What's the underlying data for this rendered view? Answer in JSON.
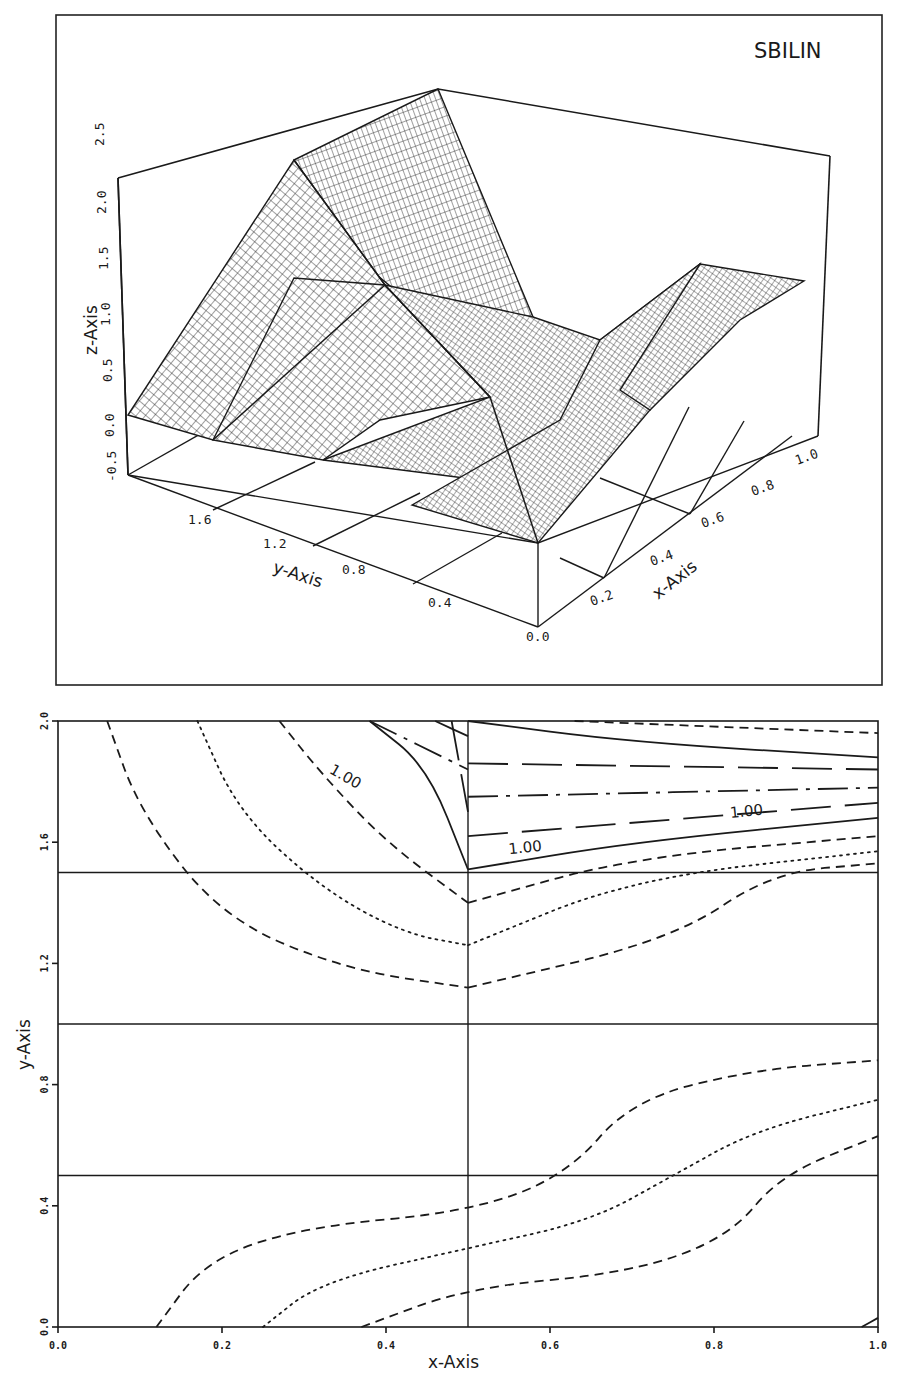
{
  "chart_data": [
    {
      "type": "surface3d",
      "title": "SBILIN",
      "xlabel": "x-Axis",
      "ylabel": "y-Axis",
      "zlabel": "z-Axis",
      "x_ticks": [
        "0.0",
        "0.2",
        "0.4",
        "0.6",
        "0.8",
        "1.0"
      ],
      "y_ticks": [
        "0.4",
        "0.8",
        "1.2",
        "1.6"
      ],
      "z_ticks": [
        "-0.5",
        "0.0",
        "0.5",
        "1.0",
        "1.5",
        "2.0",
        "2.5"
      ],
      "xlim": [
        0.0,
        1.0
      ],
      "ylim": [
        0.0,
        2.0
      ],
      "zlim": [
        -0.5,
        2.5
      ],
      "grid": true,
      "surface_nodes": {
        "description": "Piecewise bilinear surface values at node grid (x across, y down)",
        "x": [
          0.0,
          0.5,
          1.0
        ],
        "y": [
          0.0,
          0.5,
          1.0,
          1.5,
          2.0
        ],
        "z": [
          [
            0.0,
            0.0,
            1.0
          ],
          [
            0.0,
            0.0,
            1.0
          ],
          [
            0.0,
            0.5,
            1.0
          ],
          [
            0.0,
            2.0,
            1.0
          ],
          [
            0.0,
            2.3,
            1.0
          ]
        ]
      }
    },
    {
      "type": "contour",
      "xlabel": "x-Axis",
      "ylabel": "y-Axis",
      "x_ticks": [
        "0.0",
        "0.2",
        "0.4",
        "0.6",
        "0.8",
        "1.0"
      ],
      "y_ticks": [
        "0.0",
        "0.4",
        "0.8",
        "1.2",
        "1.6",
        "2.0"
      ],
      "xlim": [
        0.0,
        1.0
      ],
      "ylim": [
        0.0,
        2.0
      ],
      "cell_lines": {
        "x": [
          0.5
        ],
        "y": [
          0.5,
          1.0,
          1.5
        ]
      },
      "contour_labels": [
        {
          "text": "1.00",
          "x": 0.33,
          "y": 1.83
        },
        {
          "text": "1.00",
          "x": 0.55,
          "y": 1.56
        },
        {
          "text": "1.00",
          "x": 0.82,
          "y": 1.68
        }
      ],
      "series": [
        {
          "name": "upper-left dashed outer",
          "style": "dashed",
          "points": [
            [
              0.06,
              2.0
            ],
            [
              0.1,
              1.7
            ],
            [
              0.2,
              1.35
            ],
            [
              0.35,
              1.18
            ],
            [
              0.5,
              1.12
            ]
          ]
        },
        {
          "name": "upper-left dotted",
          "style": "dotted",
          "points": [
            [
              0.17,
              2.0
            ],
            [
              0.22,
              1.7
            ],
            [
              0.32,
              1.45
            ],
            [
              0.42,
              1.3
            ],
            [
              0.5,
              1.26
            ]
          ]
        },
        {
          "name": "upper-left dashed inner",
          "style": "dashed",
          "points": [
            [
              0.27,
              2.0
            ],
            [
              0.32,
              1.83
            ],
            [
              0.4,
              1.6
            ],
            [
              0.5,
              1.4
            ]
          ]
        },
        {
          "name": "upper-left solid 1.00",
          "style": "solid",
          "points": [
            [
              0.38,
              2.0
            ],
            [
              0.45,
              1.85
            ],
            [
              0.5,
              1.51
            ]
          ]
        },
        {
          "name": "upper-left long-dash",
          "style": "longdash",
          "points": [
            [
              0.48,
              2.0
            ],
            [
              0.5,
              1.7
            ]
          ]
        },
        {
          "name": "upper-left dash-dot",
          "style": "dashdot",
          "points": [
            [
              0.38,
              2.0
            ],
            [
              0.5,
              1.84
            ]
          ]
        },
        {
          "name": "upper-left solid top",
          "style": "solid",
          "points": [
            [
              0.46,
              2.0
            ],
            [
              0.5,
              1.95
            ]
          ]
        },
        {
          "name": "upper-right solid top",
          "style": "solid",
          "points": [
            [
              0.5,
              2.0
            ],
            [
              0.7,
              1.93
            ],
            [
              1.0,
              1.88
            ]
          ]
        },
        {
          "name": "upper-right dashed top",
          "style": "dashed",
          "points": [
            [
              0.63,
              2.0
            ],
            [
              1.0,
              1.96
            ]
          ]
        },
        {
          "name": "upper-right long-dash 1",
          "style": "longdash",
          "points": [
            [
              0.5,
              1.86
            ],
            [
              1.0,
              1.84
            ]
          ]
        },
        {
          "name": "upper-right dash-dot",
          "style": "dashdot",
          "points": [
            [
              0.5,
              1.75
            ],
            [
              1.0,
              1.78
            ]
          ]
        },
        {
          "name": "upper-right long-dash 2",
          "style": "longdash",
          "points": [
            [
              0.5,
              1.62
            ],
            [
              1.0,
              1.73
            ]
          ]
        },
        {
          "name": "upper-right solid 1.00",
          "style": "solid",
          "points": [
            [
              0.5,
              1.51
            ],
            [
              0.7,
              1.6
            ],
            [
              1.0,
              1.68
            ]
          ]
        },
        {
          "name": "upper-right dashed",
          "style": "dashed",
          "points": [
            [
              0.5,
              1.4
            ],
            [
              0.7,
              1.55
            ],
            [
              1.0,
              1.62
            ]
          ]
        },
        {
          "name": "upper-right dotted",
          "style": "dotted",
          "points": [
            [
              0.5,
              1.26
            ],
            [
              0.7,
              1.48
            ],
            [
              1.0,
              1.57
            ]
          ]
        },
        {
          "name": "upper-right dashed lower",
          "style": "dashed",
          "points": [
            [
              0.5,
              1.12
            ],
            [
              0.75,
              1.28
            ],
            [
              0.87,
              1.5
            ],
            [
              1.0,
              1.53
            ]
          ]
        },
        {
          "name": "lower dashed upper",
          "style": "dashed",
          "points": [
            [
              0.12,
              0.0
            ],
            [
              0.18,
              0.22
            ],
            [
              0.3,
              0.33
            ],
            [
              0.5,
              0.38
            ],
            [
              0.62,
              0.5
            ],
            [
              0.7,
              0.75
            ],
            [
              0.85,
              0.85
            ],
            [
              1.0,
              0.88
            ]
          ]
        },
        {
          "name": "lower dotted",
          "style": "dotted",
          "points": [
            [
              0.25,
              0.0
            ],
            [
              0.32,
              0.15
            ],
            [
              0.5,
              0.26
            ],
            [
              0.65,
              0.35
            ],
            [
              0.75,
              0.5
            ],
            [
              0.85,
              0.65
            ],
            [
              1.0,
              0.75
            ]
          ]
        },
        {
          "name": "lower dashed lower",
          "style": "dashed",
          "points": [
            [
              0.37,
              0.0
            ],
            [
              0.5,
              0.13
            ],
            [
              0.7,
              0.18
            ],
            [
              0.82,
              0.3
            ],
            [
              0.88,
              0.5
            ],
            [
              1.0,
              0.63
            ]
          ]
        },
        {
          "name": "corner solid",
          "style": "solid",
          "points": [
            [
              0.98,
              0.0
            ],
            [
              1.0,
              0.03
            ]
          ]
        }
      ]
    }
  ]
}
